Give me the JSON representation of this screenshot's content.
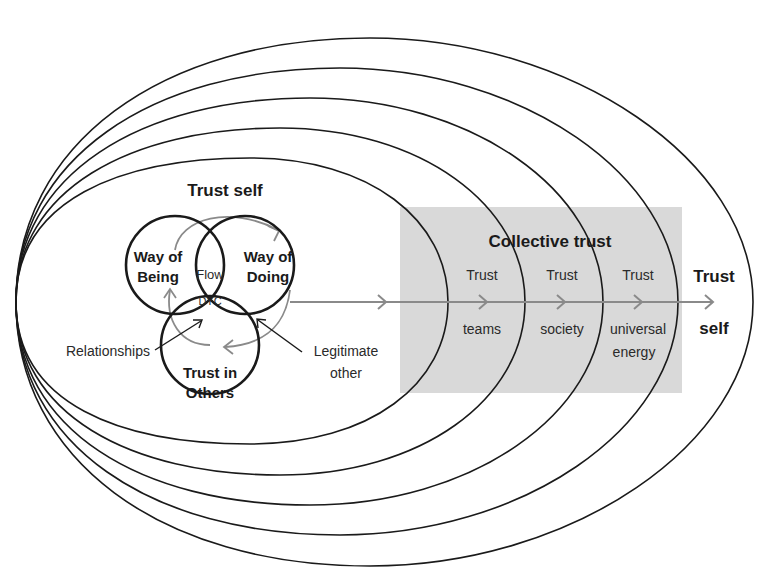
{
  "title_fragment": "",
  "colors": {
    "stroke": "#1a1a1a",
    "arrow": "#8a8a8a",
    "band": "#d9d9d9",
    "text": "#2a2a2a"
  },
  "center_cluster": {
    "heading": "Trust self",
    "circles": [
      {
        "id": "way-of-being",
        "line1": "Way of",
        "line2": "Being"
      },
      {
        "id": "way-of-doing",
        "line1": "Way of",
        "line2": "Doing"
      },
      {
        "id": "trust-in-others",
        "line1": "Trust in",
        "line2": "Others"
      }
    ],
    "intersections": {
      "top": "Flow",
      "center": "DYC"
    },
    "side_labels": {
      "left": "Relationships",
      "right_line1": "Legitimate",
      "right_line2": "other"
    }
  },
  "collective": {
    "heading": "Collective trust",
    "rings": [
      {
        "top": "Trust",
        "bottom_line1": "teams",
        "bottom_line2": ""
      },
      {
        "top": "Trust",
        "bottom_line1": "society",
        "bottom_line2": ""
      },
      {
        "top": "Trust",
        "bottom_line1": "universal",
        "bottom_line2": "energy"
      }
    ]
  },
  "outer": {
    "top": "Trust",
    "bottom": "self"
  }
}
